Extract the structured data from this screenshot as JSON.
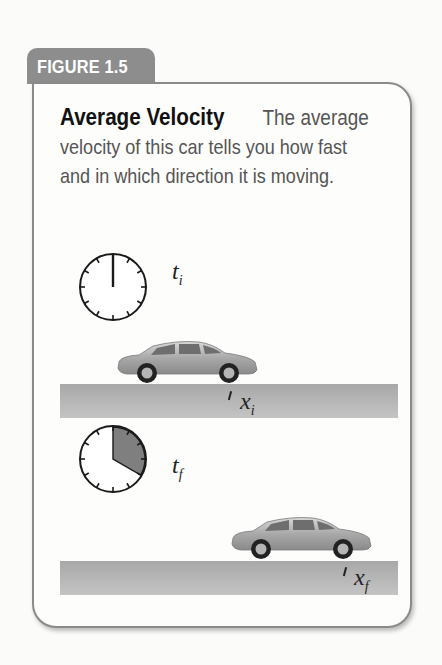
{
  "figure": {
    "tab_label": "FIGURE 1.5",
    "title": "Average Velocity",
    "caption_lines": [
      "The average",
      "velocity of this car tells you how fast",
      "and in which direction it is moving."
    ]
  },
  "illustration": {
    "initial": {
      "time_label": "t",
      "time_subscript": "i",
      "position_label": "x",
      "position_subscript": "i",
      "clock_elapsed_fraction": 0
    },
    "final": {
      "time_label": "t",
      "time_subscript": "f",
      "position_label": "x",
      "position_subscript": "f",
      "clock_elapsed_fraction": 0.333
    }
  },
  "colors": {
    "tab_bg": "#8d8d8d",
    "card_border": "#8a8a8a",
    "title_text": "#111111",
    "body_text": "#555555",
    "road": "#b3b3b3",
    "clock_wedge": "#7f7f7f"
  }
}
